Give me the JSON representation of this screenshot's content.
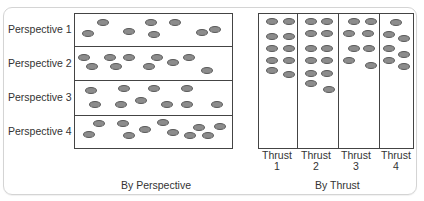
{
  "perspective_panel": {
    "rows": [
      {
        "label": "Perspective 1"
      },
      {
        "label": "Perspective 2"
      },
      {
        "label": "Perspective 3"
      },
      {
        "label": "Perspective 4"
      }
    ],
    "caption": "By Perspective"
  },
  "thrust_panel": {
    "columns": [
      {
        "label_line1": "Thrust",
        "label_line2": "1"
      },
      {
        "label_line1": "Thrust",
        "label_line2": "2"
      },
      {
        "label_line1": "Thrust",
        "label_line2": "3"
      },
      {
        "label_line1": "Thrust",
        "label_line2": "4"
      }
    ],
    "caption": "By Thrust"
  },
  "colors": {
    "dot_fill": "#8c8c8c",
    "dot_stroke": "#5a5a5a",
    "line": "#444444",
    "frame": "#d4d4d4"
  }
}
